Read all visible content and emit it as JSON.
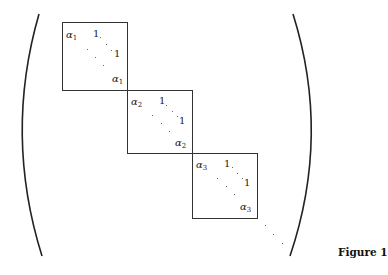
{
  "figure": {
    "caption": "Figure 1",
    "matrix": {
      "delimiter_left": "(",
      "delimiter_right": ")",
      "blocks": [
        {
          "eigenvalue_symbol": "α",
          "index": "1",
          "top_left_diag": "α",
          "top_left_sub": "1",
          "super_entry_top": "1",
          "super_entry_right": "1",
          "bottom_right_diag": "α",
          "bottom_right_sub": "1"
        },
        {
          "eigenvalue_symbol": "α",
          "index": "2",
          "top_left_diag": "α",
          "top_left_sub": "2",
          "super_entry_top": "1",
          "super_entry_right": "1",
          "bottom_right_diag": "α",
          "bottom_right_sub": "2"
        },
        {
          "eigenvalue_symbol": "α",
          "index": "3",
          "top_left_diag": "α",
          "top_left_sub": "3",
          "super_entry_top": "1",
          "super_entry_right": "1",
          "bottom_right_diag": "α",
          "bottom_right_sub": "3"
        }
      ],
      "trailing_ellipsis": "⋱"
    },
    "colors": {
      "line": "#333333",
      "text": "#222222",
      "background": "#ffffff"
    }
  }
}
